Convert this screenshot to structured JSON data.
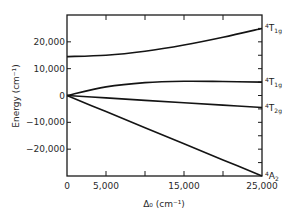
{
  "chart_data": {
    "type": "line",
    "title": "",
    "xlabel": "Δ₀ (cm⁻¹)",
    "ylabel": "Energy (cm⁻¹)",
    "xlim": [
      0,
      25000
    ],
    "ylim": [
      -30000,
      30000
    ],
    "x_ticks": [
      0,
      5000,
      10000,
      15000,
      20000,
      25000
    ],
    "x_tick_labels": [
      "0",
      "5,000",
      "",
      "15,000",
      "",
      "25,000"
    ],
    "y_ticks": [
      20000,
      10000,
      0,
      -10000,
      -20000
    ],
    "y_tick_labels": [
      "20,000",
      "10,000",
      "0",
      "-10,000",
      "-20,000"
    ],
    "grid": false,
    "legend": "none",
    "x": [
      0,
      5000,
      10000,
      15000,
      20000,
      25000
    ],
    "series": [
      {
        "name": "4T1g (upper)",
        "label_sup": "4",
        "label_main": "T",
        "label_sub": "1g",
        "values": [
          14500,
          15000,
          16500,
          18800,
          21700,
          25000
        ]
      },
      {
        "name": "4T1g (lower)",
        "label_sup": "4",
        "label_main": "T",
        "label_sub": "1g",
        "values": [
          0,
          3200,
          4800,
          5300,
          5200,
          5000
        ]
      },
      {
        "name": "4T2g",
        "label_sup": "4",
        "label_main": "T",
        "label_sub": "2g",
        "values": [
          0,
          -900,
          -1800,
          -2700,
          -3600,
          -4500
        ]
      },
      {
        "name": "4A2",
        "label_sup": "4",
        "label_main": "A",
        "label_sub": "2",
        "values": [
          0,
          -6000,
          -12000,
          -18000,
          -24000,
          -30000
        ]
      }
    ]
  }
}
